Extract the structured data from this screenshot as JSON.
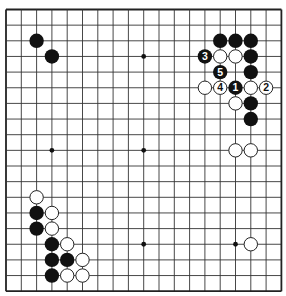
{
  "board": {
    "size": 19,
    "origin_x": 6,
    "origin_y": 9.5,
    "step_x": 15.3,
    "step_y": 15.65,
    "stone_radius": 7.2,
    "colors": {
      "line": "#333333",
      "border": "#222222",
      "black_stone": "#111111",
      "white_stone_fill": "#ffffff",
      "white_stone_edge": "#222222",
      "background": "#ffffff"
    },
    "hoshi": [
      [
        3,
        3
      ],
      [
        9,
        3
      ],
      [
        15,
        3
      ],
      [
        3,
        9
      ],
      [
        9,
        9
      ],
      [
        15,
        9
      ],
      [
        3,
        15
      ],
      [
        9,
        15
      ],
      [
        15,
        15
      ]
    ]
  },
  "stones": {
    "black": [
      {
        "col": 2,
        "row": 2
      },
      {
        "col": 3,
        "row": 3
      },
      {
        "col": 14,
        "row": 2
      },
      {
        "col": 15,
        "row": 2
      },
      {
        "col": 16,
        "row": 2
      },
      {
        "col": 13,
        "row": 3,
        "label": "3"
      },
      {
        "col": 16,
        "row": 3
      },
      {
        "col": 14,
        "row": 4,
        "label": "5"
      },
      {
        "col": 16,
        "row": 4
      },
      {
        "col": 15,
        "row": 5,
        "label": "1"
      },
      {
        "col": 16,
        "row": 6
      },
      {
        "col": 16,
        "row": 7
      },
      {
        "col": 2,
        "row": 13
      },
      {
        "col": 2,
        "row": 14
      },
      {
        "col": 3,
        "row": 15
      },
      {
        "col": 3,
        "row": 16
      },
      {
        "col": 4,
        "row": 16
      },
      {
        "col": 3,
        "row": 17
      }
    ],
    "white": [
      {
        "col": 14,
        "row": 3
      },
      {
        "col": 15,
        "row": 3
      },
      {
        "col": 13,
        "row": 5
      },
      {
        "col": 14,
        "row": 5,
        "label": "4"
      },
      {
        "col": 16,
        "row": 5
      },
      {
        "col": 17,
        "row": 5,
        "label": "2"
      },
      {
        "col": 15,
        "row": 6
      },
      {
        "col": 15,
        "row": 9
      },
      {
        "col": 16,
        "row": 9
      },
      {
        "col": 16,
        "row": 15
      },
      {
        "col": 2,
        "row": 12
      },
      {
        "col": 3,
        "row": 13
      },
      {
        "col": 3,
        "row": 14
      },
      {
        "col": 4,
        "row": 15
      },
      {
        "col": 5,
        "row": 16
      },
      {
        "col": 4,
        "row": 17
      },
      {
        "col": 5,
        "row": 17
      }
    ]
  }
}
